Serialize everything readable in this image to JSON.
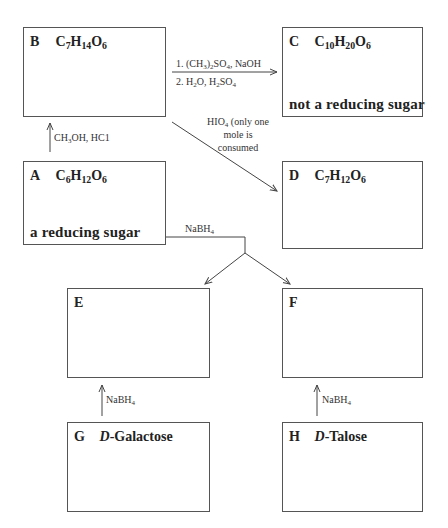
{
  "boxes": {
    "A": {
      "letter": "A",
      "formula": {
        "C": "C",
        "c_n": "6",
        "H": "H",
        "h_n": "12",
        "O": "O",
        "o_n": "6"
      },
      "footer": "a reducing sugar"
    },
    "B": {
      "letter": "B",
      "formula": {
        "C": "C",
        "c_n": "7",
        "H": "H",
        "h_n": "14",
        "O": "O",
        "o_n": "6"
      }
    },
    "C": {
      "letter": "C",
      "formula": {
        "C": "C",
        "c_n": "10",
        "H": "H",
        "h_n": "20",
        "O": "O",
        "o_n": "6"
      },
      "footer": "not a reducing sugar"
    },
    "D": {
      "letter": "D",
      "formula": {
        "C": "C",
        "c_n": "7",
        "H": "H",
        "h_n": "12",
        "O": "O",
        "o_n": "6"
      }
    },
    "E": {
      "letter": "E"
    },
    "F": {
      "letter": "F"
    },
    "G": {
      "letter": "G",
      "name_prefix": "D",
      "name_rest": "-Galactose"
    },
    "H": {
      "letter": "H",
      "name_prefix": "D",
      "name_rest": "-Talose"
    }
  },
  "reagents": {
    "a_to_b": {
      "part1": "CH",
      "sub1": "3",
      "part2": "OH, HC1"
    },
    "b_to_c": {
      "step1": {
        "prefix": "1. (CH",
        "sub1": "3",
        "mid": ")",
        "sub2": "2",
        "mid2": "SO",
        "sub3": "4",
        "suffix": ", NaOH"
      },
      "step2": {
        "prefix": "2. H",
        "sub1": "2",
        "mid": "O, H",
        "sub2": "2",
        "mid2": "SO",
        "sub3": "4"
      }
    },
    "b_to_d": {
      "line1_prefix": "HIO",
      "line1_sub": "4",
      "line1_suffix": " (only one",
      "line2": "mole is",
      "line3": "consumed"
    },
    "a_to_ef": {
      "prefix": "NaBH",
      "sub": "4"
    },
    "g_to_e": {
      "prefix": "NaBH",
      "sub": "4"
    },
    "h_to_f": {
      "prefix": "NaBH",
      "sub": "4"
    }
  },
  "colors": {
    "line": "#444444",
    "box_border": "#555555",
    "text": "#222222"
  }
}
